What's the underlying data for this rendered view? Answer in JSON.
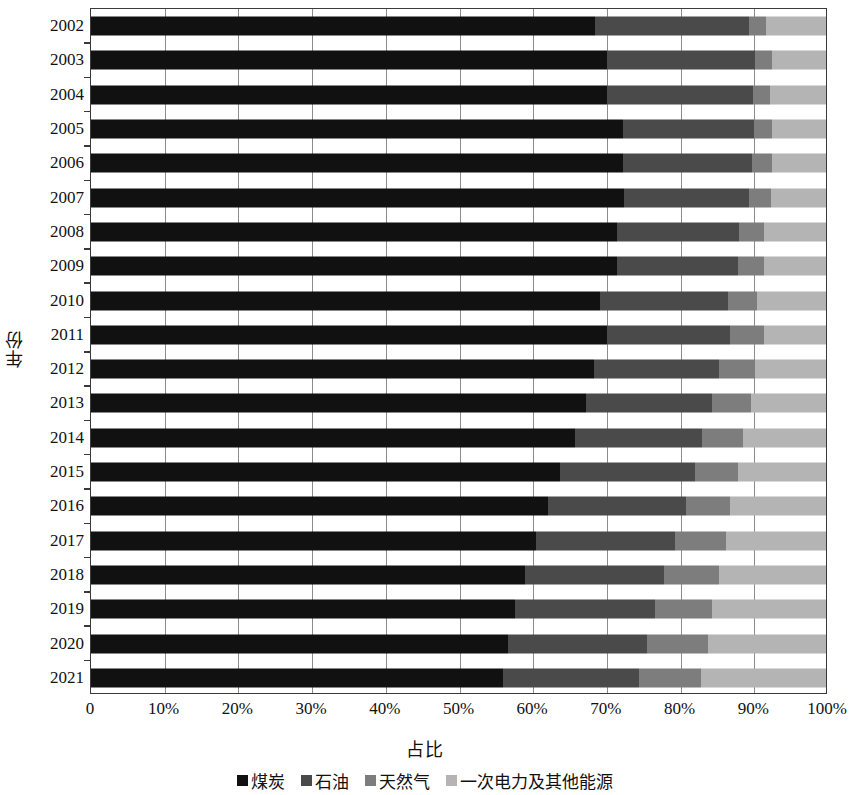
{
  "chart_data": {
    "type": "bar",
    "orientation": "horizontal",
    "stacked": true,
    "normalized": true,
    "title": "",
    "xlabel": "占比",
    "ylabel": "年份",
    "xlim": [
      0,
      100
    ],
    "grid": true,
    "legend_position": "bottom",
    "xtick_labels": [
      "0",
      "10%",
      "20%",
      "30%",
      "40%",
      "50%",
      "60%",
      "70%",
      "80%",
      "90%",
      "100%"
    ],
    "xtick_values": [
      0,
      10,
      20,
      30,
      40,
      50,
      60,
      70,
      80,
      90,
      100
    ],
    "categories": [
      "2002",
      "2003",
      "2004",
      "2005",
      "2006",
      "2007",
      "2008",
      "2009",
      "2010",
      "2011",
      "2012",
      "2013",
      "2014",
      "2015",
      "2016",
      "2017",
      "2018",
      "2019",
      "2020",
      "2021"
    ],
    "series": [
      {
        "name": "煤炭",
        "color": "#111111",
        "values": [
          68.5,
          70.2,
          70.2,
          72.4,
          72.4,
          72.5,
          71.5,
          71.6,
          69.2,
          70.2,
          68.5,
          67.4,
          65.8,
          63.8,
          62.2,
          60.6,
          59.0,
          57.7,
          56.8,
          56.0
        ]
      },
      {
        "name": "石油",
        "color": "#4a4a4a",
        "values": [
          21.0,
          20.1,
          19.9,
          17.8,
          17.5,
          17.0,
          16.7,
          16.4,
          17.4,
          16.8,
          17.0,
          17.1,
          17.3,
          18.4,
          18.7,
          18.9,
          18.9,
          19.0,
          18.9,
          18.5
        ]
      },
      {
        "name": "天然气",
        "color": "#7d7d7d",
        "values": [
          2.3,
          2.3,
          2.3,
          2.4,
          2.7,
          3.0,
          3.4,
          3.5,
          4.0,
          4.6,
          4.8,
          5.3,
          5.6,
          5.8,
          6.1,
          6.9,
          7.6,
          7.8,
          8.2,
          8.5
        ]
      },
      {
        "name": "一次电力及其他能源",
        "color": "#b4b4b4",
        "values": [
          8.2,
          7.4,
          7.6,
          7.4,
          7.4,
          7.5,
          8.4,
          8.5,
          9.4,
          8.4,
          9.7,
          10.2,
          11.3,
          12.0,
          13.0,
          13.6,
          14.5,
          15.5,
          16.1,
          17.0
        ]
      }
    ]
  },
  "legend": {
    "items": [
      {
        "label": "煤炭",
        "key": "coal"
      },
      {
        "label": "石油",
        "key": "oil"
      },
      {
        "label": "天然气",
        "key": "gas"
      },
      {
        "label": "一次电力及其他能源",
        "key": "other"
      }
    ]
  }
}
